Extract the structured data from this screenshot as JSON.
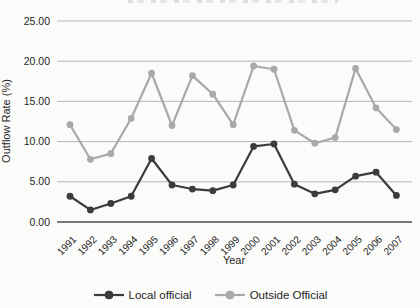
{
  "figure": {
    "background": "#fbfbfa",
    "gridline_color": "#b6b6b6",
    "axis_line_color": "#4d4d4d",
    "text_color": "#1f1f1f"
  },
  "chart_data": {
    "type": "line",
    "title": "",
    "xlabel": "Year",
    "ylabel": "Outflow Rate (%)",
    "categories": [
      "1991",
      "1992",
      "1993",
      "1994",
      "1995",
      "1996",
      "1997",
      "1998",
      "1999",
      "2000",
      "2001",
      "2002",
      "2003",
      "2004",
      "2005",
      "2006",
      "2007"
    ],
    "ytick_labels": [
      "0.00",
      "5.00",
      "10.00",
      "15.00",
      "20.00",
      "25.00"
    ],
    "ylim": [
      0,
      25
    ],
    "grid": true,
    "legend_position": "bottom",
    "series": [
      {
        "name": "Local official",
        "color": "#3b3b3b",
        "values": [
          3.2,
          1.5,
          2.3,
          3.2,
          7.9,
          4.6,
          4.1,
          3.9,
          4.6,
          9.4,
          9.7,
          4.7,
          3.5,
          4.0,
          5.7,
          6.2,
          3.3
        ]
      },
      {
        "name": "Outside Official",
        "color": "#a9a9a9",
        "values": [
          12.1,
          7.8,
          8.5,
          12.9,
          18.5,
          12.0,
          18.2,
          15.9,
          12.1,
          19.4,
          19.0,
          11.4,
          9.8,
          10.5,
          19.1,
          14.2,
          11.5
        ]
      }
    ]
  }
}
